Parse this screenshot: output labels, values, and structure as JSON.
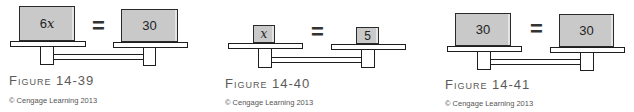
{
  "figures": [
    {
      "id": "figure-14-39",
      "left_value": "6",
      "left_variable": "x",
      "equals": "=",
      "right_value": "30",
      "caption": "Figure 14-39",
      "copyright": "© Cengage Learning 2013"
    },
    {
      "id": "figure-14-40",
      "left_value": "",
      "left_variable": "x",
      "equals": "=",
      "right_value": "5",
      "caption": "Figure 14-40",
      "copyright": "© Cengage Learning 2013"
    },
    {
      "id": "figure-14-41",
      "left_value": "30",
      "left_variable": "",
      "equals": "=",
      "right_value": "30",
      "caption": "Figure 14-41",
      "copyright": "© Cengage Learning 2013"
    }
  ],
  "colors": {
    "box_fill": "#c9c9c9",
    "outline": "#1e1e1e",
    "caption_text": "#5a5a5a"
  }
}
